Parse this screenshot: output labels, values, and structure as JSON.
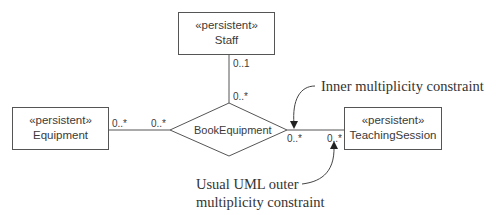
{
  "classes": {
    "staff": {
      "stereotype": "«persistent»",
      "name": "Staff"
    },
    "equipment": {
      "stereotype": "«persistent»",
      "name": "Equipment"
    },
    "teaching_session": {
      "stereotype": "«persistent»",
      "name": "TeachingSession"
    }
  },
  "association": {
    "name": "BookEquipment",
    "multiplicities": {
      "staff_outer": "0..1",
      "staff_inner": "0..*",
      "equipment_outer": "0..*",
      "equipment_inner": "0..*",
      "session_inner": "0..*",
      "session_outer": "0..*"
    }
  },
  "annotations": {
    "inner": "Inner multiplicity constraint",
    "outer_line1": "Usual UML outer",
    "outer_line2": "multiplicity constraint"
  },
  "colors": {
    "line": "#555555",
    "text": "#3a3a3a"
  }
}
